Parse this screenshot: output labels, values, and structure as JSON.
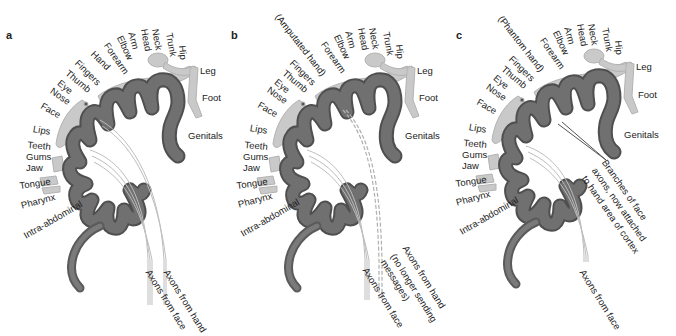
{
  "figure": {
    "colors": {
      "cortex": "#6f6f6f",
      "cortex_edge": "#4a4a4a",
      "homunculus": "#c9c9c9",
      "axon": "#bdbdbd",
      "text": "#222222"
    },
    "panels": [
      {
        "letter": "a",
        "hand_label": "Hand",
        "body_labels": [
          "Fingers",
          "Forearm",
          "Elbow",
          "Arm",
          "Head",
          "Neck",
          "Trunk",
          "Hip",
          "Leg",
          "Foot",
          "Genitals"
        ],
        "face_labels": [
          "Thumb",
          "Eye",
          "Nose",
          "Face",
          "Lips",
          "Teeth",
          "Gums",
          "Jaw",
          "Tongue",
          "Pharynx",
          "Intra-abdominal"
        ],
        "axon_labels": [
          "Axons from hand",
          "Axons from face"
        ]
      },
      {
        "letter": "b",
        "hand_label": "(Amputated hand)",
        "body_labels": [
          "Fingers",
          "Forearm",
          "Elbow",
          "Arm",
          "Head",
          "Neck",
          "Trunk",
          "Hip",
          "Leg",
          "Foot",
          "Genitals"
        ],
        "face_labels": [
          "Thumb",
          "Eye",
          "Nose",
          "Face",
          "Lips",
          "Teeth",
          "Gums",
          "Jaw",
          "Tongue",
          "Pharynx",
          "Intra-abdominal"
        ],
        "axon_labels": [
          "Axons from hand",
          "(no longer sending",
          "messages)",
          "Axons from face"
        ]
      },
      {
        "letter": "c",
        "hand_label": "(Phantom hand)",
        "body_labels": [
          "Fingers",
          "Forearm",
          "Elbow",
          "Arm",
          "Head",
          "Neck",
          "Trunk",
          "Hip",
          "Leg",
          "Foot",
          "Genitals"
        ],
        "face_labels": [
          "Thumb",
          "Eye",
          "Nose",
          "Face",
          "Lips",
          "Teeth",
          "Gums",
          "Jaw",
          "Tongue",
          "Pharynx",
          "Intra-abdominal"
        ],
        "axon_labels": [
          "Branches of face",
          "axons, now attached",
          "to hand area of cortex",
          "Axons from face"
        ]
      }
    ]
  }
}
